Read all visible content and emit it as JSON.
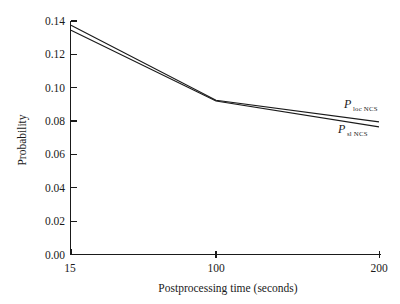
{
  "chart_data": {
    "type": "line",
    "title": "",
    "xlabel": "Postprocessing time (seconds)",
    "ylabel": "Probability",
    "x": [
      15,
      100,
      200
    ],
    "xtick_labels": [
      "15",
      "100",
      "200"
    ],
    "xtick_positions": [
      15,
      100,
      200
    ],
    "ytick_labels": [
      "0.00",
      "0.02",
      "0.04",
      "0.06",
      "0.08",
      "0.10",
      "0.12",
      "0.14"
    ],
    "ytick_values": [
      0.0,
      0.02,
      0.04,
      0.06,
      0.08,
      0.1,
      0.12,
      0.14
    ],
    "ylim": [
      0.0,
      0.14
    ],
    "xlim": [
      15,
      200
    ],
    "grid": false,
    "legend_position": "inline-right",
    "series": [
      {
        "name": "P_loc NCS",
        "label_main": "P",
        "label_sub": "loc NCS",
        "values": [
          0.1375,
          0.0925,
          0.0795
        ],
        "color": "#1a1a1a"
      },
      {
        "name": "P_sl NCS",
        "label_main": "P",
        "label_sub": "sl NCS",
        "values": [
          0.1345,
          0.092,
          0.0765
        ],
        "color": "#1a1a1a"
      }
    ]
  },
  "axes": {
    "y_title": "Probability",
    "x_title": "Postprocessing time (seconds)",
    "ytick_0": "0.00",
    "ytick_1": "0.02",
    "ytick_2": "0.04",
    "ytick_3": "0.06",
    "ytick_4": "0.08",
    "ytick_5": "0.10",
    "ytick_6": "0.12",
    "ytick_7": "0.14",
    "xtick_0": "15",
    "xtick_1": "100",
    "xtick_2": "200"
  },
  "labels": {
    "series1_main": "P",
    "series1_sub": "loc NCS",
    "series2_main": "P",
    "series2_sub": "sl NCS"
  }
}
